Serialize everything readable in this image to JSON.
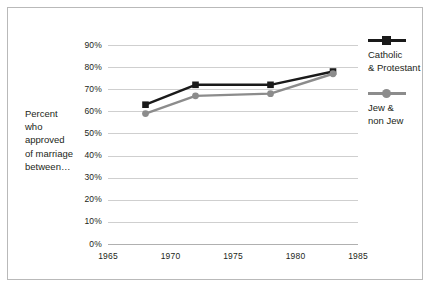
{
  "chart_data": {
    "type": "line",
    "title": "",
    "subtitle": "",
    "xlabel": "",
    "ylabel": "Percent who approved of marriage between…",
    "ylabel_lines": [
      "Percent",
      "who",
      "approved",
      "of marriage",
      "between…"
    ],
    "xlim": [
      1965,
      1985
    ],
    "ylim": [
      0,
      90
    ],
    "grid": true,
    "legend_position": "right",
    "x_tick_labels": [
      "1965",
      "1970",
      "1975",
      "1980",
      "1985"
    ],
    "x_ticks": [
      1965,
      1970,
      1975,
      1980,
      1985
    ],
    "y_tick_labels": [
      "0%",
      "10%",
      "20%",
      "30%",
      "40%",
      "50%",
      "60%",
      "70%",
      "80%",
      "90%"
    ],
    "y_ticks": [
      0,
      10,
      20,
      30,
      40,
      50,
      60,
      70,
      80,
      90
    ],
    "x": [
      1968,
      1972,
      1978,
      1983
    ],
    "series": [
      {
        "name": "Catholic & Protestant",
        "name_lines": [
          "Catholic",
          "& Protestant"
        ],
        "color": "#1a1a1a",
        "marker": "square",
        "values": [
          63,
          72,
          72,
          78
        ]
      },
      {
        "name": "Jew & non Jew",
        "name_lines": [
          "Jew &",
          "non Jew"
        ],
        "color": "#8c8c8c",
        "marker": "circle",
        "values": [
          59,
          67,
          68,
          77
        ]
      }
    ]
  },
  "figure": {
    "border_color": "#b9b9b9",
    "grid_color": "#cfcfcf",
    "background": "#ffffff",
    "text_color": "#231f20"
  }
}
